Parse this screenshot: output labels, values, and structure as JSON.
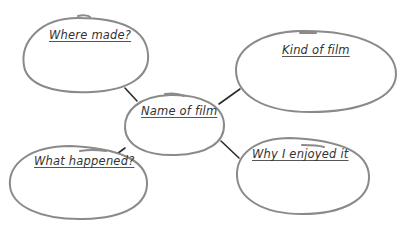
{
  "diagram": {
    "type": "mind-map",
    "center": {
      "title": "Name of film"
    },
    "nodes": [
      {
        "id": "where-made",
        "title": "Where made?"
      },
      {
        "id": "kind-of-film",
        "title": "Kind of film"
      },
      {
        "id": "what-happened",
        "title": "What happened?"
      },
      {
        "id": "why-enjoyed",
        "title": "Why I enjoyed it"
      }
    ],
    "edges": [
      {
        "from": "Name of film",
        "to": "Where made?"
      },
      {
        "from": "Name of film",
        "to": "Kind of film"
      },
      {
        "from": "Name of film",
        "to": "What happened?"
      },
      {
        "from": "Name of film",
        "to": "Why I enjoyed it"
      }
    ],
    "colors": {
      "bubble_stroke": "#8a8a8a",
      "connector": "#2b2b2b",
      "text": "#333333",
      "background": "#ffffff"
    }
  }
}
